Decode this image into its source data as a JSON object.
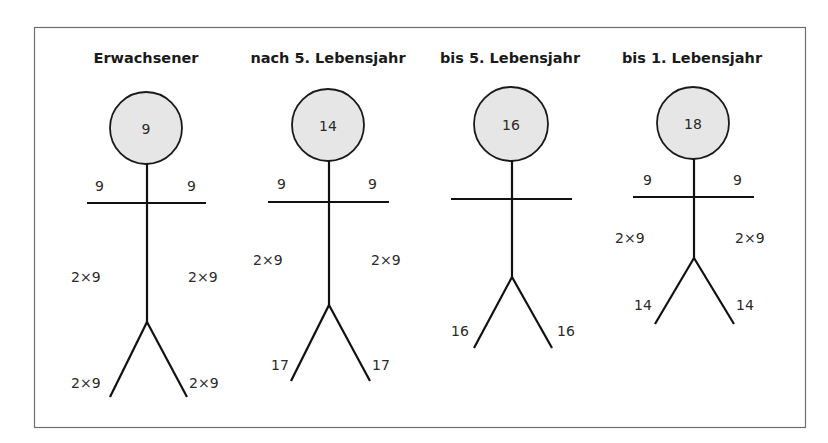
{
  "diagram": {
    "colors": {
      "frame": "#6e6e6e",
      "head_fill": "#e6e6e6",
      "stroke": "#111111"
    },
    "figures": [
      {
        "title": "Erwachsener",
        "head": "9",
        "arm_left": "9",
        "arm_right": "9",
        "trunk_left": "2×9",
        "trunk_right": "2×9",
        "leg_left": "2×9",
        "leg_right": "2×9",
        "geom": {
          "cx": 146,
          "cy": 128,
          "r": 36,
          "armY": 203,
          "armX1": 87,
          "armX2": 206,
          "hipY": 322,
          "legY": 397,
          "legDX": 38,
          "armLabelY": 191,
          "trunkLabelY": 282,
          "legLabelY": 388
        }
      },
      {
        "title": "nach 5. Lebensjahr",
        "head": "14",
        "arm_left": "9",
        "arm_right": "9",
        "trunk_left": "2×9",
        "trunk_right": "2×9",
        "leg_left": "17",
        "leg_right": "17",
        "geom": {
          "cx": 328,
          "cy": 125,
          "r": 36,
          "armY": 202,
          "armX1": 268,
          "armX2": 389,
          "hipY": 305,
          "legY": 381,
          "legDX": 39,
          "armLabelY": 189,
          "trunkLabelY": 265,
          "legLabelY": 370
        }
      },
      {
        "title": "bis 5. Lebensjahr",
        "head": "16",
        "arm_left": "",
        "arm_right": "",
        "trunk_left": "",
        "trunk_right": "",
        "leg_left": "16",
        "leg_right": "16",
        "geom": {
          "cx": 511,
          "cy": 124,
          "r": 37,
          "armY": 199,
          "armX1": 451,
          "armX2": 572,
          "hipY": 277,
          "legY": 348,
          "legDX": 39,
          "armLabelY": 186,
          "trunkLabelY": 250,
          "legLabelY": 336
        }
      },
      {
        "title": "bis 1. Lebensjahr",
        "head": "18",
        "arm_left": "9",
        "arm_right": "9",
        "trunk_left": "2×9",
        "trunk_right": "2×9",
        "leg_left": "14",
        "leg_right": "14",
        "geom": {
          "cx": 693,
          "cy": 123,
          "r": 36,
          "armY": 197,
          "armX1": 633,
          "armX2": 754,
          "hipY": 258,
          "legY": 324,
          "legDX": 39,
          "armLabelY": 185,
          "trunkLabelY": 243,
          "legLabelY": 310
        }
      }
    ]
  }
}
